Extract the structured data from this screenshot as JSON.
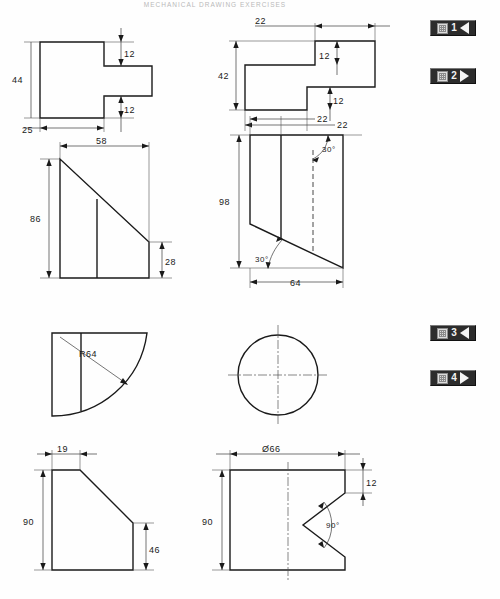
{
  "page": {
    "header_title": "MECHANICAL DRAWING EXERCISES",
    "width": 500,
    "height": 599,
    "background": "#ffffff",
    "ink_color": "#1a1a1a"
  },
  "nav_buttons": [
    {
      "name": "nav-button-1",
      "number": "1",
      "arrow": "left",
      "arrow_glyph": "◀"
    },
    {
      "name": "nav-button-2",
      "number": "2",
      "arrow": "right",
      "arrow_glyph": "▶"
    },
    {
      "name": "nav-button-3",
      "number": "3",
      "arrow": "left",
      "arrow_glyph": "◀"
    },
    {
      "name": "nav-button-4",
      "number": "4",
      "arrow": "right",
      "arrow_glyph": "▶"
    }
  ],
  "figures": [
    {
      "id": "fig-1",
      "name": "tee-profile",
      "position": "row1-left",
      "shape": "T-shaped stepped profile",
      "dimensions": {
        "height_left": "44",
        "step_top": "12",
        "step_bottom": "12",
        "width_left": "25"
      }
    },
    {
      "id": "fig-2",
      "name": "z-stepped-profile",
      "position": "row1-right",
      "shape": "Z / S-shaped stepped profile",
      "dimensions": {
        "height_left": "42",
        "step_upper": "12",
        "step_lower": "12",
        "offset_top": "22",
        "offset_bottom": "22"
      }
    },
    {
      "id": "fig-3",
      "name": "wedge-profile",
      "position": "row2-left",
      "shape": "Right trapezoid wedge with interior rib line",
      "dimensions": {
        "width": "58",
        "height_left": "86",
        "height_right": "28"
      }
    },
    {
      "id": "fig-4",
      "name": "parallelogram-prism",
      "position": "row2-right",
      "shape": "Parallelogram with hidden edge and two 30 degree angles",
      "dimensions": {
        "height": "98",
        "width_bottom": "64",
        "offset_top": "22",
        "angle_upper": "30°",
        "angle_lower": "30°"
      }
    },
    {
      "id": "fig-5",
      "name": "quarter-round-profile",
      "position": "row3-left",
      "shape": "Quarter circle arc profile with interior rib line",
      "dimensions": {
        "radius": "R64"
      }
    },
    {
      "id": "fig-6",
      "name": "circle-with-centerlines",
      "position": "row3-right",
      "shape": "Full circle with horizontal and vertical centrelines",
      "dimensions": {}
    },
    {
      "id": "fig-7",
      "name": "chamfered-block-profile",
      "position": "row4-left",
      "shape": "Block with chamfered top-right corner",
      "dimensions": {
        "top_width": "19",
        "height_left": "90",
        "height_right": "46"
      }
    },
    {
      "id": "fig-8",
      "name": "vee-notch-cylinder",
      "position": "row4-right",
      "shape": "Cylinder front view with 90 degree vee notch",
      "dimensions": {
        "diameter": "Ø66",
        "notch_offset": "12",
        "height": "90",
        "notch_angle": "90°"
      }
    }
  ]
}
